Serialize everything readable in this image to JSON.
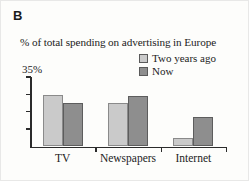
{
  "figure": {
    "panel_letter": "B",
    "title": "% of total spending on advertising in Europe"
  },
  "legend": {
    "items": [
      {
        "label": "Two years ago",
        "swatch": "light-gray-swatch",
        "color": "#cacaca"
      },
      {
        "label": "Now",
        "swatch": "dark-gray-swatch",
        "color": "#8e8e8e"
      }
    ]
  },
  "axis": {
    "y_max_label": "35%",
    "x_labels": [
      "TV",
      "Newspapers",
      "Internet"
    ]
  },
  "chart_data": {
    "type": "bar",
    "title": "% of total spending on advertising in Europe",
    "xlabel": "",
    "ylabel": "% of total spending",
    "ylim": [
      0,
      35
    ],
    "grid": false,
    "legend_position": "top-right",
    "categories": [
      "TV",
      "Newspapers",
      "Internet"
    ],
    "series": [
      {
        "name": "Two years ago",
        "color": "#cacaca",
        "values": [
          26,
          22,
          4.5
        ]
      },
      {
        "name": "Now",
        "color": "#8e8e8e",
        "values": [
          22,
          25.5,
          15
        ]
      }
    ],
    "yticks": [
      0,
      8.75,
      17.5,
      26.25,
      35
    ],
    "ytick_labels": [
      "",
      "",
      "",
      "",
      "35%"
    ]
  }
}
